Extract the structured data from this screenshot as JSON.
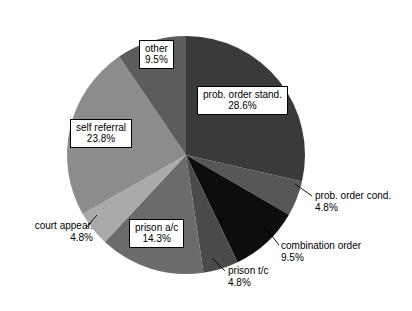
{
  "chart_data": {
    "type": "pie",
    "title": "",
    "subtitle": "",
    "xlabel": "",
    "ylabel": "",
    "legend_position": "none",
    "grid": false,
    "start_angle_deg": 0,
    "direction": "clockwise",
    "categories": [
      "prob. order stand.",
      "prob. order cond.",
      "combination order",
      "prison t/c",
      "prison a/c",
      "court appear.",
      "self referral",
      "other"
    ],
    "values": [
      28.6,
      4.8,
      9.5,
      4.8,
      14.3,
      4.8,
      23.8,
      9.5
    ],
    "value_labels": [
      "28.6%",
      "4.8%",
      "9.5%",
      "4.8%",
      "14.3%",
      "4.8%",
      "23.8%",
      "9.5%"
    ],
    "colors": [
      "#3a3a3a",
      "#575757",
      "#0d0d0d",
      "#4a4a4a",
      "#6b6b6b",
      "#aaaaaa",
      "#8c8c8c",
      "#5c5c5c"
    ],
    "units": "percent",
    "total": 100.1
  },
  "slices": [
    {
      "id": "prob-order-stand",
      "name": "prob. order stand.",
      "percent": "28.6%",
      "value": 28.6,
      "color": "#3a3a3a",
      "label_style": "boxed-inside"
    },
    {
      "id": "prob-order-cond",
      "name": "prob. order cond.",
      "percent": "4.8%",
      "value": 4.8,
      "color": "#575757",
      "label_style": "outside-leader"
    },
    {
      "id": "combination-order",
      "name": "combination order",
      "percent": "9.5%",
      "value": 9.5,
      "color": "#0d0d0d",
      "label_style": "outside-leader"
    },
    {
      "id": "prison-tc",
      "name": "prison t/c",
      "percent": "4.8%",
      "value": 4.8,
      "color": "#4a4a4a",
      "label_style": "outside-leader"
    },
    {
      "id": "prison-ac",
      "name": "prison a/c",
      "percent": "14.3%",
      "value": 14.3,
      "color": "#6b6b6b",
      "label_style": "boxed-inside"
    },
    {
      "id": "court-appear",
      "name": "court appear.",
      "percent": "4.8%",
      "value": 4.8,
      "color": "#aaaaaa",
      "label_style": "outside-leader"
    },
    {
      "id": "self-referral",
      "name": "self referral",
      "percent": "23.8%",
      "value": 23.8,
      "color": "#8c8c8c",
      "label_style": "boxed-inside"
    },
    {
      "id": "other",
      "name": "other",
      "percent": "9.5%",
      "value": 9.5,
      "color": "#5c5c5c",
      "label_style": "boxed-inside"
    }
  ],
  "geometry": {
    "center_x": 186,
    "center_y": 155,
    "radius": 119
  }
}
